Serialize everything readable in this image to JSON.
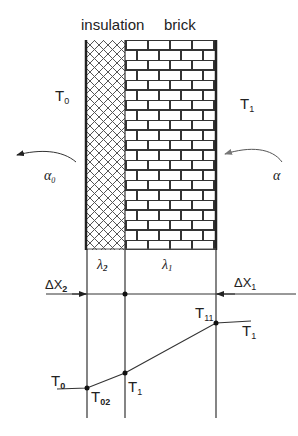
{
  "title": {
    "insulation": "insulation",
    "brick": "brick"
  },
  "ambient": {
    "left_temp": {
      "main": "T",
      "sub": "0"
    },
    "right_temp": {
      "main": "T",
      "sub": "1"
    },
    "left_coeff": {
      "main": "α",
      "sub": "0"
    },
    "right_coeff": {
      "main": "α",
      "sub": ""
    }
  },
  "conductivity": {
    "insulation": {
      "main": "λ",
      "sub": "2"
    },
    "brick": {
      "main": "λ",
      "sub": "1"
    }
  },
  "thickness": {
    "insulation": {
      "main": "ΔX",
      "sub": "2"
    },
    "brick": {
      "main": "ΔX",
      "sub": "1"
    }
  },
  "profile": {
    "left_ambient": {
      "main": "T",
      "sub": "0"
    },
    "outer_surface": {
      "main": "T",
      "sub": "02"
    },
    "interface": {
      "main": "T",
      "sub": "1"
    },
    "inner_surface": {
      "main": "T",
      "sub": "11"
    },
    "right_ambient": {
      "main": "T",
      "sub": "1"
    }
  },
  "colors": {
    "line": "#222222",
    "brick_mortar": "#333333",
    "hatch": "#444444"
  }
}
